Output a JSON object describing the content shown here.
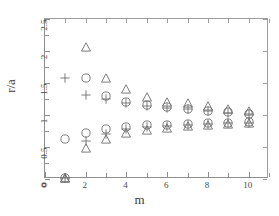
{
  "chart_data": {
    "type": "scatter",
    "title": "",
    "xlabel": "m",
    "ylabel": "r/a",
    "xlim": [
      0,
      11
    ],
    "ylim": [
      0,
      2.5
    ],
    "grid": false,
    "legend": "none",
    "xticks": [
      0,
      1,
      2,
      3,
      4,
      5,
      6,
      7,
      8,
      9,
      10,
      11
    ],
    "xticklabels": [
      "0",
      "",
      "2",
      "",
      "4",
      "",
      "6",
      "",
      "8",
      "",
      "10",
      ""
    ],
    "yticks": [
      0,
      0.5,
      1,
      1.5,
      2,
      2.5
    ],
    "yticklabels": [
      "0",
      "0.5",
      "1",
      "1.5",
      "2",
      "2.5"
    ],
    "x": [
      1,
      2,
      3,
      4,
      5,
      6,
      7,
      8,
      9,
      10
    ],
    "series": [
      {
        "name": "upper-triangle",
        "marker": "triangle",
        "values": [
          0.02,
          2.07,
          1.58,
          1.4,
          1.28,
          1.21,
          1.18,
          1.14,
          1.1,
          1.07
        ]
      },
      {
        "name": "upper-circle",
        "marker": "circle",
        "values": [
          0.62,
          1.58,
          1.3,
          1.2,
          1.15,
          1.12,
          1.1,
          1.07,
          1.04,
          1.02
        ]
      },
      {
        "name": "upper-plus",
        "marker": "plus",
        "values": [
          1.58,
          1.32,
          1.25,
          1.18,
          1.14,
          1.11,
          1.09,
          1.06,
          1.03,
          1.01
        ]
      },
      {
        "name": "lower-circle",
        "marker": "circle",
        "values": [
          0.02,
          0.72,
          0.78,
          0.82,
          0.84,
          0.85,
          0.86,
          0.87,
          0.88,
          0.89
        ]
      },
      {
        "name": "lower-plus",
        "marker": "plus",
        "values": [
          0.02,
          0.6,
          0.71,
          0.78,
          0.81,
          0.83,
          0.85,
          0.86,
          0.87,
          0.88
        ]
      },
      {
        "name": "lower-triangle",
        "marker": "triangle",
        "values": [
          0.02,
          0.48,
          0.62,
          0.72,
          0.77,
          0.8,
          0.83,
          0.84,
          0.86,
          0.87
        ]
      }
    ],
    "colors": {
      "marker": "#6f6f6f",
      "axis": "#8e8e8e",
      "text": "#3a3a3a",
      "background": "#ffffff"
    }
  }
}
